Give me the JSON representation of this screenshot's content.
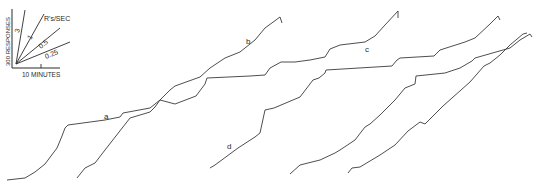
{
  "chart_data": {
    "type": "line",
    "title": "",
    "subtitle": "Cumulative records",
    "xlabel": "10 MINUTES",
    "ylabel": "300 RESPONSES",
    "grid": false,
    "legend": {
      "position": "top-left",
      "title": "R's/SEC",
      "rates": [
        "3",
        "1",
        "0.5",
        "0.25"
      ]
    },
    "annotations": [
      {
        "text": "a",
        "x": 104,
        "y": 117
      },
      {
        "text": "b",
        "x": 248,
        "y": 42
      },
      {
        "text": "c",
        "x": 367,
        "y": 50
      },
      {
        "text": "d",
        "x": 229,
        "y": 147
      }
    ],
    "series": [
      {
        "name": "record-1",
        "points": [
          [
            7,
            180
          ],
          [
            25,
            178
          ],
          [
            35,
            172
          ],
          [
            40,
            168
          ],
          [
            45,
            164
          ],
          [
            57,
            148
          ],
          [
            62,
            136
          ],
          [
            65,
            128
          ],
          [
            68,
            125
          ],
          [
            105,
            120
          ],
          [
            120,
            117
          ],
          [
            123,
            113
          ],
          [
            150,
            108
          ],
          [
            160,
            100
          ],
          [
            170,
            90
          ],
          [
            175,
            86
          ],
          [
            200,
            77
          ],
          [
            210,
            68
          ],
          [
            225,
            58
          ],
          [
            240,
            52
          ],
          [
            255,
            40
          ],
          [
            265,
            28
          ],
          [
            280,
            17
          ],
          [
            282,
            23
          ]
        ]
      },
      {
        "name": "record-2",
        "points": [
          [
            77,
            178
          ],
          [
            85,
            168
          ],
          [
            95,
            163
          ],
          [
            105,
            150
          ],
          [
            130,
            118
          ],
          [
            150,
            112
          ],
          [
            155,
            107
          ],
          [
            160,
            100
          ],
          [
            175,
            104
          ],
          [
            196,
            96
          ],
          [
            205,
            84
          ],
          [
            207,
            78
          ],
          [
            250,
            76
          ],
          [
            265,
            75
          ],
          [
            270,
            68
          ],
          [
            281,
            62
          ],
          [
            295,
            62
          ],
          [
            310,
            60
          ],
          [
            325,
            57
          ],
          [
            330,
            49
          ],
          [
            340,
            45
          ],
          [
            365,
            42
          ],
          [
            375,
            36
          ],
          [
            385,
            25
          ],
          [
            398,
            11
          ],
          [
            398,
            18
          ]
        ]
      },
      {
        "name": "record-3",
        "points": [
          [
            210,
            168
          ],
          [
            215,
            165
          ],
          [
            238,
            148
          ],
          [
            255,
            137
          ],
          [
            260,
            133
          ],
          [
            265,
            110
          ],
          [
            274,
            108
          ],
          [
            300,
            97
          ],
          [
            313,
            80
          ],
          [
            319,
            78
          ],
          [
            325,
            73
          ],
          [
            326,
            70
          ],
          [
            392,
            66
          ],
          [
            397,
            60
          ],
          [
            400,
            58
          ],
          [
            434,
            56
          ],
          [
            440,
            50
          ],
          [
            465,
            42
          ],
          [
            475,
            38
          ],
          [
            490,
            24
          ],
          [
            498,
            16
          ],
          [
            500,
            20
          ]
        ]
      },
      {
        "name": "record-4",
        "points": [
          [
            290,
            174
          ],
          [
            300,
            165
          ],
          [
            320,
            160
          ],
          [
            335,
            153
          ],
          [
            340,
            150
          ],
          [
            355,
            140
          ],
          [
            365,
            127
          ],
          [
            370,
            124
          ],
          [
            380,
            115
          ],
          [
            395,
            100
          ],
          [
            405,
            88
          ],
          [
            415,
            84
          ],
          [
            416,
            76
          ],
          [
            445,
            73
          ],
          [
            460,
            68
          ],
          [
            472,
            61
          ],
          [
            475,
            58
          ],
          [
            510,
            48
          ],
          [
            520,
            40
          ],
          [
            530,
            34
          ],
          [
            532,
            37
          ]
        ]
      },
      {
        "name": "record-5",
        "points": [
          [
            348,
            173
          ],
          [
            352,
            168
          ],
          [
            360,
            167
          ],
          [
            380,
            155
          ],
          [
            395,
            145
          ],
          [
            408,
            131
          ],
          [
            420,
            122
          ],
          [
            425,
            124
          ],
          [
            443,
            106
          ],
          [
            470,
            82
          ],
          [
            484,
            66
          ],
          [
            490,
            63
          ],
          [
            500,
            55
          ],
          [
            510,
            45
          ],
          [
            523,
            34
          ],
          [
            527,
            33
          ]
        ]
      }
    ]
  }
}
